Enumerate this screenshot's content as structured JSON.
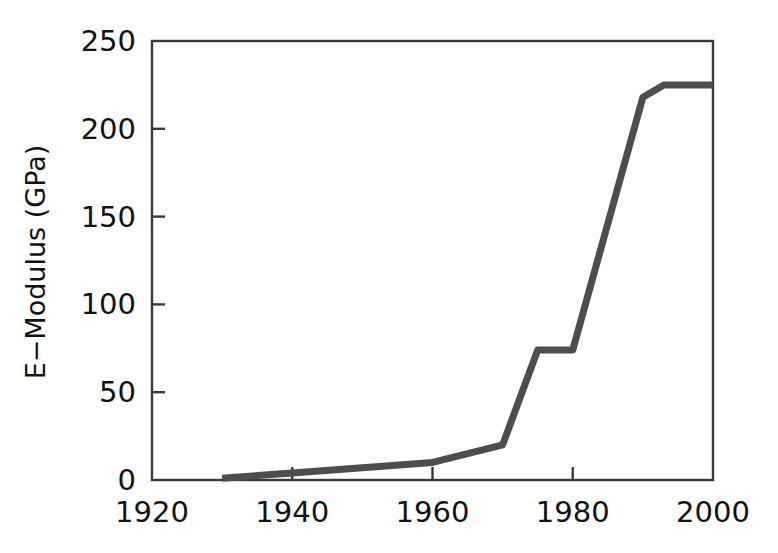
{
  "chart_data": {
    "type": "line",
    "title": "",
    "xlabel": "",
    "ylabel": "E−Modulus (GPa)",
    "xlim": [
      1920,
      2000
    ],
    "ylim": [
      0,
      250
    ],
    "grid": false,
    "legend": "none",
    "xticks": [
      "1920",
      "1940",
      "1960",
      "1980",
      "2000"
    ],
    "xtick_values": [
      1920,
      1940,
      1960,
      1980,
      2000
    ],
    "yticks": [
      "0",
      "50",
      "100",
      "150",
      "200",
      "250"
    ],
    "ytick_values": [
      0,
      50,
      100,
      150,
      200,
      250
    ],
    "series": [
      {
        "name": "E-Modulus",
        "color": "#4d4d4d",
        "x": [
          1930,
          1940,
          1950,
          1960,
          1970,
          1975,
          1980,
          1990,
          1993,
          2000
        ],
        "y": [
          1,
          4,
          7,
          10,
          20,
          74,
          74,
          218,
          225,
          225
        ]
      }
    ],
    "annotations": []
  },
  "style": {
    "line_color": "#4d4d4d",
    "axis_color": "#3a3a3a",
    "text_color": "#111111",
    "background": "#ffffff",
    "line_width": 7
  },
  "axis": {
    "y_title": "E−Modulus (GPa)"
  }
}
